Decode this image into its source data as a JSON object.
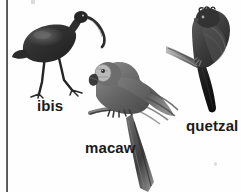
{
  "figure": {
    "kind": "photographic-figure",
    "background_color": "#fefefe",
    "rule_color": "#3c3c3c",
    "label_color": "#1b1b1b",
    "width": 241,
    "height": 192
  },
  "birds": [
    {
      "id": "ibis",
      "label": "ibis",
      "description": "dark wading bird standing with long downcurved bill and long thin legs",
      "plumage_color": "#3a3a3a",
      "position": "left"
    },
    {
      "id": "macaw",
      "label": "macaw",
      "description": "perched parrot with hooked beak, pale cheek patch and very long tail",
      "plumage_color": "#6b6b6b",
      "position": "center"
    },
    {
      "id": "quetzal",
      "label": "quetzal",
      "description": "bird perched on a branch with long dark tail",
      "plumage_color": "#4a4a4a",
      "position": "right"
    }
  ]
}
